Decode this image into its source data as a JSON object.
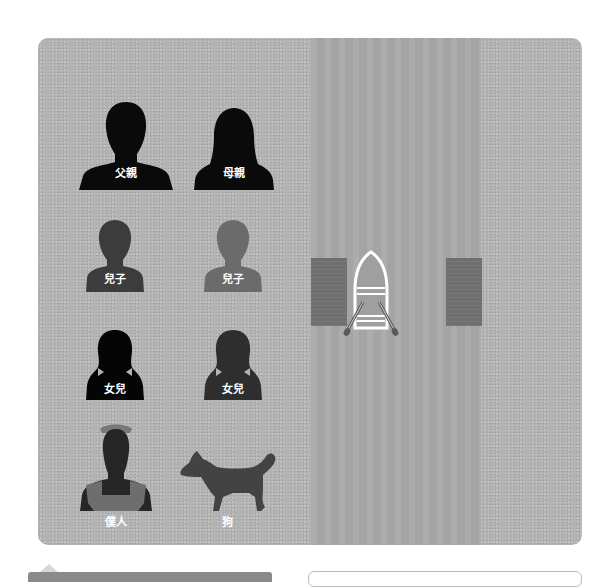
{
  "game": {
    "scene": "river-crossing",
    "colors": {
      "land": "#b3b3b3",
      "river": "#a9a9a9",
      "dock": "#6f6f6f",
      "boat_outline": "#ffffff"
    }
  },
  "characters": [
    {
      "id": "father",
      "label": "父親",
      "color": "#0a0a0a"
    },
    {
      "id": "mother",
      "label": "母親",
      "color": "#0a0a0a"
    },
    {
      "id": "son-1",
      "label": "兒子",
      "color": "#3c3c3c"
    },
    {
      "id": "son-2",
      "label": "兒子",
      "color": "#6b6b6b"
    },
    {
      "id": "daughter-1",
      "label": "女兒",
      "color": "#050505"
    },
    {
      "id": "daughter-2",
      "label": "女兒",
      "color": "#2e2e2e"
    },
    {
      "id": "servant",
      "label": "僕人",
      "color": "#262626"
    },
    {
      "id": "dog",
      "label": "狗",
      "color": "#434343"
    }
  ],
  "boat": {
    "position": "left-dock",
    "passengers": []
  }
}
